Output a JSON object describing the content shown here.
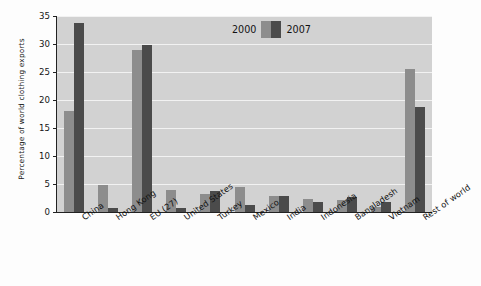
{
  "chart_data": {
    "type": "bar",
    "title": "",
    "subtitle": "",
    "xlabel": "",
    "ylabel": "Percentage of world clothing exports",
    "ylim": [
      0,
      35
    ],
    "ytick_step": 5,
    "yticks": [
      35,
      30,
      25,
      20,
      15,
      10,
      5,
      0
    ],
    "grid": true,
    "grid_axis": "y",
    "legend_position": "top-center",
    "categories": [
      "China",
      "Hong Kong",
      "EU (27)",
      "United States",
      "Turkey",
      "Mexico",
      "India",
      "Indonesia",
      "Bangladesh",
      "Vietnam",
      "Rest of world"
    ],
    "series": [
      {
        "name": "2000",
        "color": "#8d8d8d",
        "values": [
          18.0,
          4.8,
          28.9,
          3.9,
          3.3,
          4.4,
          2.9,
          2.4,
          2.1,
          0.9,
          25.6
        ]
      },
      {
        "name": "2007",
        "color": "#4b4b4b",
        "values": [
          33.8,
          0.7,
          29.9,
          0.8,
          3.8,
          1.2,
          2.8,
          1.8,
          2.6,
          1.8,
          18.7
        ]
      }
    ],
    "plot_background": "#d2d2d2",
    "gridline_color": "#f2f2f2"
  },
  "legend": {
    "label_2000": "2000",
    "label_2007": "2007"
  }
}
